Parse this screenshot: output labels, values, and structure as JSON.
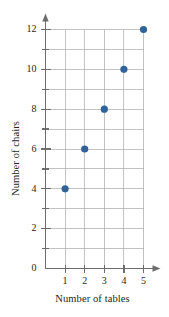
{
  "chart_data": {
    "type": "scatter",
    "title": "",
    "xlabel": "Number of tables",
    "ylabel": "Number of chairs",
    "x": [
      1,
      2,
      3,
      4,
      5
    ],
    "values": [
      4,
      6,
      8,
      10,
      12
    ],
    "points": [
      {
        "x": 1,
        "y": 4
      },
      {
        "x": 2,
        "y": 6
      },
      {
        "x": 3,
        "y": 8
      },
      {
        "x": 4,
        "y": 10
      },
      {
        "x": 5,
        "y": 12
      }
    ],
    "xlim": [
      0,
      5
    ],
    "ylim": [
      0,
      12
    ],
    "x_ticks": [
      1,
      2,
      3,
      4,
      5
    ],
    "x_tick_labels": [
      "1",
      "2",
      "3",
      "4",
      "5"
    ],
    "y_ticks": [
      0,
      1,
      2,
      3,
      4,
      5,
      6,
      7,
      8,
      9,
      10,
      11,
      12
    ],
    "y_tick_labels": [
      "0",
      "",
      "2",
      "",
      "4",
      "",
      "6",
      "",
      "8",
      "",
      "10",
      "",
      "12"
    ],
    "y_labeled_ticks": [
      0,
      2,
      4,
      6,
      8,
      10,
      12
    ],
    "grid": true,
    "grid_x_lines": [
      1,
      2,
      3,
      4,
      5
    ],
    "grid_y_lines": [
      1,
      2,
      3,
      4,
      5,
      6,
      7,
      8,
      9,
      10,
      11,
      12
    ],
    "legend": null,
    "legend_position": "none",
    "marker_color": "#2f6399",
    "grid_color": "#a9a9a9",
    "axis_color": "#6d6d6d",
    "background_color": "#ffffff",
    "axis_arrows": true
  }
}
